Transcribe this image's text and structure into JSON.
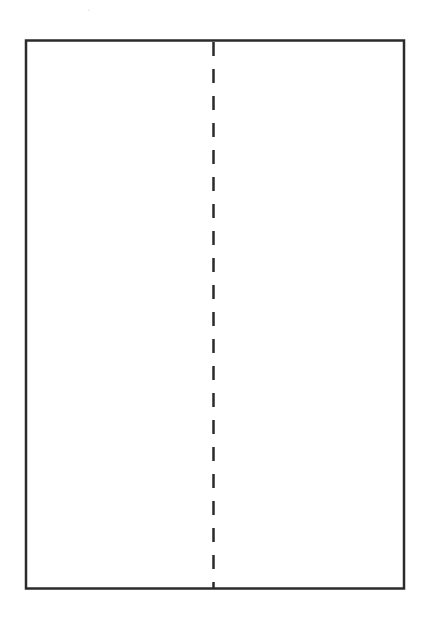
{
  "diagram": {
    "shapes": [
      {
        "kind": "rectangle",
        "name": "outer-rectangle",
        "style": "solid"
      },
      {
        "kind": "line",
        "name": "center-fold-line",
        "style": "dashed",
        "orientation": "vertical"
      }
    ],
    "colors": {
      "stroke": "#2b2b2b",
      "background": "#ffffff"
    }
  }
}
